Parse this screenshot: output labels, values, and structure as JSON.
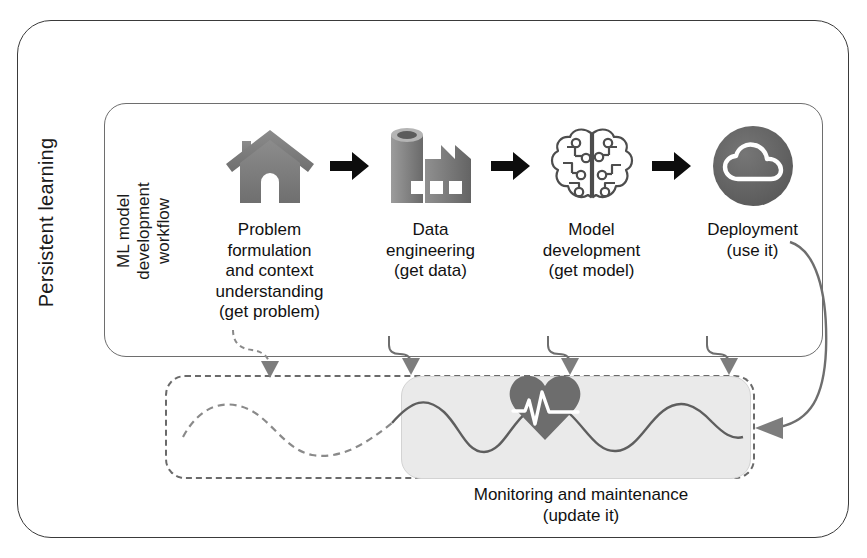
{
  "diagram": {
    "outer_label": "Persistent learning",
    "workflow_label_lines": [
      "ML model",
      "development",
      "workflow"
    ],
    "steps": [
      {
        "icon": "house-icon",
        "lines": [
          "Problem",
          "formulation",
          "and context",
          "understanding",
          "(get problem)"
        ]
      },
      {
        "icon": "factory-icon",
        "lines": [
          "Data",
          "engineering",
          "(get data)"
        ]
      },
      {
        "icon": "brain-circuit-icon",
        "lines": [
          "Model",
          "development",
          "(get model)"
        ]
      },
      {
        "icon": "cloud-circle-icon",
        "lines": [
          "Deployment",
          "(use it)"
        ]
      }
    ],
    "separator_icon": "right-arrow-icon",
    "monitoring": {
      "icon": "heart-pulse-icon",
      "wave_icon": "sine-wave-icon",
      "lines": [
        "Monitoring and maintenance",
        "(update it)"
      ]
    },
    "feedback_arrows": {
      "down_icon": "down-arrow-icon",
      "return_icon": "left-arrow-icon",
      "count": 4
    },
    "colors": {
      "outline": "#3a3a3a",
      "inner_outline": "#6e6e6e",
      "icon_gray": "#7a7a7a",
      "icon_dark": "#4f4f4f",
      "arrow_black": "#0d0d0d",
      "panel_gray": "#eaeaea",
      "dashed": "#6a6a6a",
      "text": "#111111"
    }
  }
}
